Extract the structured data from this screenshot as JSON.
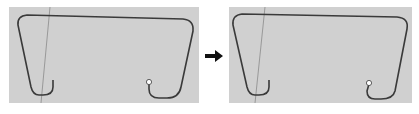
{
  "figure": {
    "panels": [
      {
        "id": "before",
        "description": "Curve path with rounded corners and two hook ends, open endpoint marked"
      },
      {
        "id": "after",
        "description": "Same curve path after transformation"
      }
    ],
    "arrow_icon": "right-arrow",
    "colors": {
      "panel_bg": "#d0d0d0",
      "curve": "#3a3a3a",
      "guide_line": "#8a8a8a",
      "endpoint": "#ffffff"
    }
  }
}
